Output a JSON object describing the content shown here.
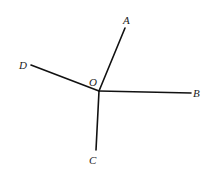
{
  "diagram": {
    "type": "rays-from-point",
    "center": {
      "label": "O",
      "x": 99,
      "y": 91,
      "label_x": 89,
      "label_y": 86
    },
    "rays": [
      {
        "label": "A",
        "x": 125,
        "y": 28,
        "label_x": 123,
        "label_y": 24
      },
      {
        "label": "B",
        "x": 191,
        "y": 93,
        "label_x": 193,
        "label_y": 97
      },
      {
        "label": "C",
        "x": 96,
        "y": 150,
        "label_x": 89,
        "label_y": 164
      },
      {
        "label": "D",
        "x": 31,
        "y": 65,
        "label_x": 19,
        "label_y": 69
      }
    ],
    "stroke_color": "#111111"
  }
}
